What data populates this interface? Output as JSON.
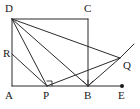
{
  "figure": {
    "type": "geometry-diagram",
    "width": 140,
    "height": 109,
    "background_color": "#ffffff",
    "stroke_color": "#2b2b2b",
    "label_color": "#1a1a1a"
  },
  "points": [
    {
      "name": "A",
      "label": "A",
      "x": 12,
      "y": 86,
      "label_x": 5,
      "label_y": 90,
      "marked_dot": false
    },
    {
      "name": "B",
      "label": "B",
      "x": 88,
      "y": 86,
      "label_x": 84,
      "label_y": 90,
      "marked_dot": false
    },
    {
      "name": "C",
      "label": "C",
      "x": 88,
      "y": 19,
      "label_x": 84,
      "label_y": 3,
      "marked_dot": false
    },
    {
      "name": "D",
      "label": "D",
      "x": 12,
      "y": 19,
      "label_x": 5,
      "label_y": 3,
      "marked_dot": false
    },
    {
      "name": "E",
      "label": "E",
      "x": 122,
      "y": 86,
      "label_x": 118,
      "label_y": 90,
      "marked_dot": true
    },
    {
      "name": "P",
      "label": "P",
      "x": 47,
      "y": 86,
      "label_x": 43,
      "label_y": 90,
      "marked_dot": false
    },
    {
      "name": "Q",
      "label": "Q",
      "x": 120,
      "y": 58,
      "label_x": 123,
      "label_y": 60,
      "marked_dot": false
    },
    {
      "name": "R",
      "label": "R",
      "x": 12,
      "y": 54,
      "label_x": 3,
      "label_y": 48,
      "marked_dot": false
    }
  ],
  "segments": [
    {
      "name": "side-AD",
      "from": "A",
      "to": "D"
    },
    {
      "name": "side-DC",
      "from": "D",
      "to": "C"
    },
    {
      "name": "side-CB",
      "from": "C",
      "to": "B"
    },
    {
      "name": "baseline-A-E",
      "from": "A",
      "to": "E"
    },
    {
      "name": "segment-DP",
      "from": "D",
      "to": "P"
    },
    {
      "name": "segment-DB",
      "from": "D",
      "to": "B"
    },
    {
      "name": "segment-DQ",
      "from": "D",
      "to": "Q"
    },
    {
      "name": "segment-RP",
      "from": "R",
      "to": "P"
    },
    {
      "name": "segment-PQ",
      "from": "P",
      "to": "Q"
    },
    {
      "name": "segment-BQ",
      "from": "B",
      "to": "Q"
    }
  ],
  "rays": [
    {
      "name": "ray-beyond-Q",
      "from": "Q",
      "to_x": 134,
      "to_y": 44
    }
  ],
  "angle_marks": [
    {
      "name": "right-angle-at-P",
      "vertex": "P",
      "kind": "right-angle-square",
      "size": 5,
      "orientation": "up-right"
    },
    {
      "name": "angle-mark-at-B",
      "vertex": "B",
      "kind": "tick-cluster",
      "size": 5
    }
  ]
}
